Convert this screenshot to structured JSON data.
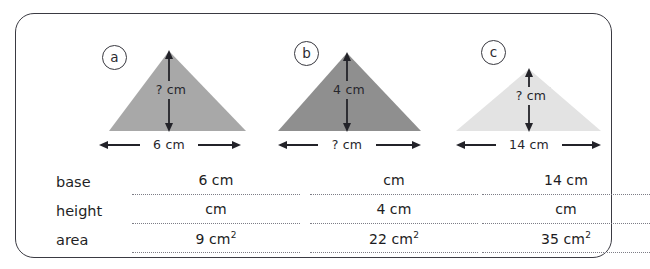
{
  "worksheet": {
    "figures": [
      {
        "id": "a",
        "label": "a",
        "fill_color": "#a8a8a8",
        "height_text": "? cm",
        "base_text": "6 cm",
        "apex_x": 93,
        "base_left": 33,
        "base_right": 170,
        "apex_y": 15,
        "base_y": 95,
        "arrow_x": 93,
        "arrow_top": 16,
        "arrow_bottom": 94,
        "base_arrow_left": 25,
        "base_arrow_right": 162,
        "base_arrow_y": 109
      },
      {
        "id": "b",
        "label": "b",
        "fill_color": "#8f8f8f",
        "height_text": "4 cm",
        "base_text": "? cm",
        "apex_x": 91,
        "base_left": 22,
        "base_right": 165,
        "apex_y": 17,
        "base_y": 95,
        "arrow_x": 91,
        "arrow_top": 18,
        "arrow_bottom": 94,
        "base_arrow_left": 22,
        "base_arrow_right": 165,
        "base_arrow_y": 109
      },
      {
        "id": "c",
        "label": "c",
        "fill_color": "#e3e3e3",
        "height_text": "? cm",
        "base_text": "14 cm",
        "apex_x": 93,
        "base_left": 20,
        "base_right": 165,
        "apex_y": 33,
        "base_y": 95,
        "arrow_x": 93,
        "arrow_top": 34,
        "arrow_bottom": 94,
        "base_arrow_left": 20,
        "base_arrow_right": 165,
        "base_arrow_y": 109
      }
    ],
    "table": {
      "row_labels": [
        "base",
        "height",
        "area"
      ],
      "rows": [
        {
          "label": "base",
          "cells": [
            {
              "value": "6",
              "unit": "cm",
              "squared": false
            },
            {
              "value": "",
              "unit": "cm",
              "squared": false
            },
            {
              "value": "14",
              "unit": "cm",
              "squared": false
            }
          ]
        },
        {
          "label": "height",
          "cells": [
            {
              "value": "",
              "unit": "cm",
              "squared": false
            },
            {
              "value": "4",
              "unit": "cm",
              "squared": false
            },
            {
              "value": "",
              "unit": "cm",
              "squared": false
            }
          ]
        },
        {
          "label": "area",
          "cells": [
            {
              "value": "9",
              "unit": "cm",
              "squared": true
            },
            {
              "value": "22",
              "unit": "cm",
              "squared": true
            },
            {
              "value": "35",
              "unit": "cm",
              "squared": true
            }
          ]
        }
      ]
    },
    "colors": {
      "frame_border": "#3a3a42",
      "text": "#1f1f25",
      "dotted_line": "#7d7d86",
      "arrow": "#232329"
    }
  }
}
